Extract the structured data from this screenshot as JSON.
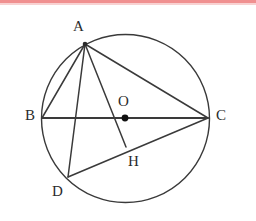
{
  "figure": {
    "type": "geometry-diagram",
    "background_color": "#ffffff",
    "stroke_color": "#3a3a3a",
    "label_color": "#2b2b2b",
    "top_band_color": "#ef8a8a",
    "circle": {
      "name": "circle-o",
      "cx": 125.5,
      "cy": 118.5,
      "r": 84
    },
    "points": [
      {
        "id": "A",
        "label": "A",
        "x": 85,
        "y": 44,
        "label_x": 73,
        "label_y": 19,
        "dot": true
      },
      {
        "id": "B",
        "label": "B",
        "x": 42,
        "y": 118,
        "label_x": 25,
        "label_y": 108,
        "dot": false
      },
      {
        "id": "C",
        "label": "C",
        "x": 208,
        "y": 118,
        "label_x": 216,
        "label_y": 108,
        "dot": false
      },
      {
        "id": "D",
        "label": "D",
        "x": 68,
        "y": 177,
        "label_x": 52,
        "label_y": 184,
        "dot": false
      },
      {
        "id": "O",
        "label": "O",
        "x": 125,
        "y": 118,
        "label_x": 118,
        "label_y": 94,
        "dot": true
      },
      {
        "id": "H",
        "label": "H",
        "x": 126,
        "y": 147,
        "label_x": 128,
        "label_y": 154,
        "dot": false
      }
    ],
    "segments": [
      {
        "name": "segment-ab",
        "from": "A",
        "to": "B",
        "x1": 85,
        "y1": 44,
        "x2": 42,
        "y2": 118
      },
      {
        "name": "segment-ad",
        "from": "A",
        "to": "D",
        "x1": 85,
        "y1": 44,
        "x2": 68,
        "y2": 177
      },
      {
        "name": "segment-ah",
        "from": "A",
        "to": "H",
        "x1": 85,
        "y1": 44,
        "x2": 126,
        "y2": 147
      },
      {
        "name": "segment-ac",
        "from": "A",
        "to": "C",
        "x1": 85,
        "y1": 44,
        "x2": 208,
        "y2": 118
      },
      {
        "name": "segment-bc",
        "from": "B",
        "to": "C",
        "x1": 42,
        "y1": 118,
        "x2": 208,
        "y2": 118
      },
      {
        "name": "segment-dc",
        "from": "D",
        "to": "C",
        "x1": 68,
        "y1": 177,
        "x2": 208,
        "y2": 118
      }
    ],
    "labels": {
      "A": "A",
      "B": "B",
      "C": "C",
      "D": "D",
      "O": "O",
      "H": "H"
    }
  }
}
